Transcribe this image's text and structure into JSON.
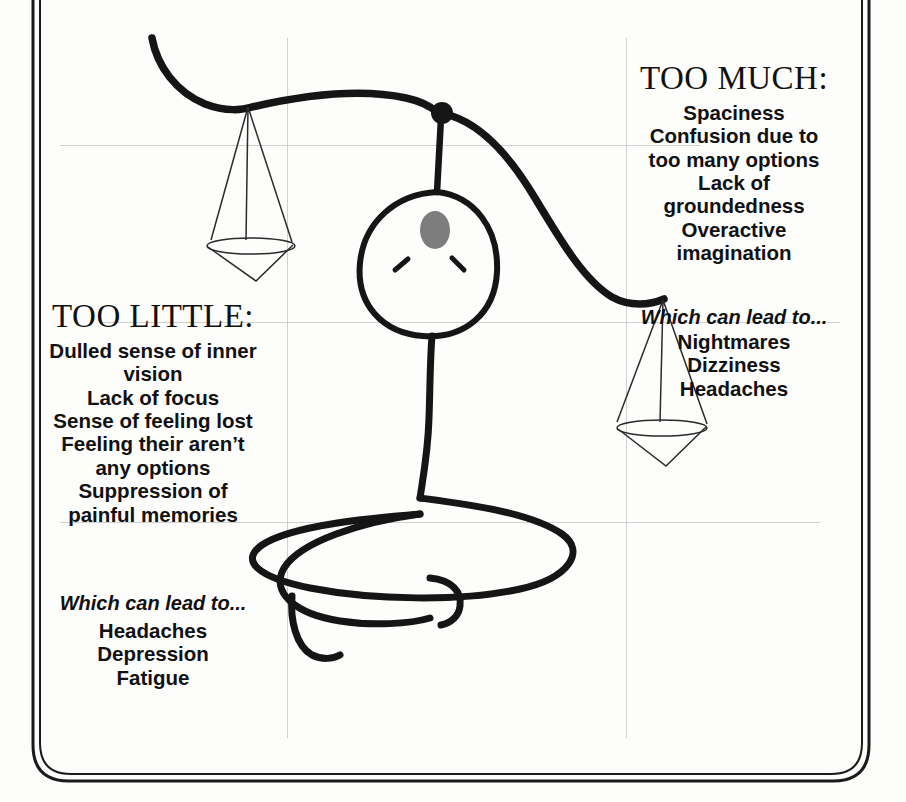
{
  "figure": {
    "title_alt": "Seated meditating stick figure holding a balance scale",
    "third_eye_icon": "third-eye-oval-icon",
    "third_eye_color": "#7d7d7d",
    "ink_color": "#151515",
    "grid_color": "#c9c9c9",
    "grid": {
      "horizontal_y": [
        145,
        322,
        522
      ],
      "vertical_x": [
        287,
        626
      ]
    }
  },
  "too_much": {
    "heading": "TOO MUCH:",
    "symptoms": [
      "Spaciness",
      "Confusion due to",
      "too many options",
      "Lack of",
      "groundedness",
      "Overactive",
      "imagination"
    ],
    "lead_in": "Which can lead to...",
    "effects": [
      "Nightmares",
      "Dizziness",
      "Headaches"
    ]
  },
  "too_little": {
    "heading": "TOO LITTLE:",
    "symptoms": [
      "Dulled sense of inner",
      "vision",
      "Lack of focus",
      "Sense of feeling lost",
      "Feeling their aren’t",
      "any options",
      "Suppression of",
      "painful memories"
    ],
    "lead_in": "Which can lead to...",
    "effects": [
      "Headaches",
      "Depression",
      "Fatigue"
    ]
  }
}
